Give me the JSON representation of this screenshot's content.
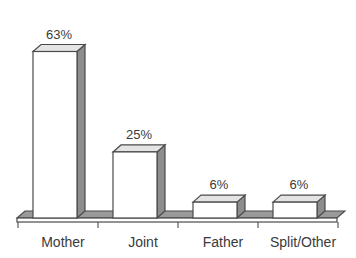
{
  "chart_data": {
    "type": "bar",
    "title": "",
    "subtitle": "",
    "xlabel": "",
    "ylabel": "",
    "categories": [
      "Mother",
      "Joint",
      "Father",
      "Split/Other"
    ],
    "values": [
      63,
      25,
      6,
      6
    ],
    "value_labels": [
      "63%",
      "25%",
      "6%",
      "6%"
    ],
    "ylim": [
      0,
      70
    ],
    "grid": false,
    "legend": false,
    "legend_position": "none",
    "units": "%",
    "style": {
      "bar_front_color": "#ffffff",
      "bar_side_color": "#8d8d8d",
      "bar_top_color": "#e4e4e4",
      "outline_color": "#4a4a4a",
      "text_color": "#3a3a3a",
      "background_color": "#ffffff",
      "three_d": true
    },
    "bars": [
      {
        "category": "Mother",
        "value": 63,
        "label": "63%"
      },
      {
        "category": "Joint",
        "value": 25,
        "label": "25%"
      },
      {
        "category": "Father",
        "value": 6,
        "label": "6%"
      },
      {
        "category": "Split/Other",
        "value": 6,
        "label": "6%"
      }
    ]
  }
}
